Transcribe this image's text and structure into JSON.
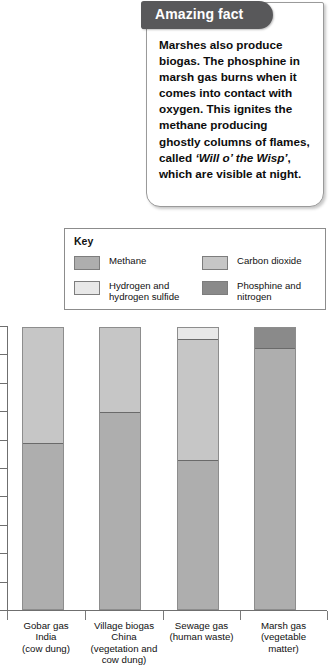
{
  "fact": {
    "banner_label": "Amazing fact",
    "body_before": "Marshes also produce biogas. The phosphine in marsh gas burns when it comes into contact with oxygen. This ignites the methane producing ghostly columns of flames, called ",
    "body_emphasis": "‘Will o’ the Wisp’",
    "body_after": ", which are visible at night."
  },
  "key": {
    "title": "Key",
    "entries": [
      {
        "label": "Methane",
        "color": "#aeaeae"
      },
      {
        "label": "Hydrogen and\nhydrogen sulfide",
        "color": "#e8e8e8"
      },
      {
        "label": "Carbon dioxide",
        "color": "#c6c6c6"
      },
      {
        "label": "Phosphine and\nnitrogen",
        "color": "#8a8a8a"
      }
    ]
  },
  "chart_data": {
    "type": "bar",
    "subtype": "stacked-100-percent",
    "title": "",
    "xlabel": "",
    "ylabel": "",
    "ylim": [
      0,
      100
    ],
    "grid": false,
    "legend_position": "above-plot",
    "y_tick_count": 10,
    "y_tick_labels": [],
    "categories": [
      "Gobar gas\nIndia\n(cow dung)",
      "Village biogas\nChina\n(vegetation and\ncow dung)",
      "Sewage gas\n(human waste)",
      "Marsh gas\n(vegetable\nmatter)"
    ],
    "series": [
      {
        "name": "Methane",
        "color": "#aeaeae",
        "values": [
          59,
          70,
          53,
          93
        ]
      },
      {
        "name": "Carbon dioxide",
        "color": "#c6c6c6",
        "values": [
          41,
          30,
          43,
          0
        ]
      },
      {
        "name": "Hydrogen and hydrogen sulfide",
        "color": "#e8e8e8",
        "values": [
          0,
          0,
          4,
          0
        ]
      },
      {
        "name": "Phosphine and nitrogen",
        "color": "#8a8a8a",
        "values": [
          0,
          0,
          0,
          7
        ]
      }
    ]
  }
}
